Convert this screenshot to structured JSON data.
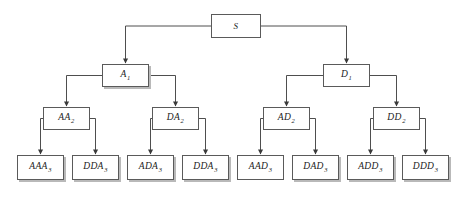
{
  "diagram": {
    "type": "tree",
    "title": "",
    "canvas": {
      "width": 461,
      "height": 197,
      "background": "#ffffff"
    },
    "style": {
      "node_fill": "#ffffff",
      "node_border": "#5a5a5a",
      "edge_color": "#3a3a3a",
      "shadow_color": "#b9b9b9",
      "text_color": "#1a1a1a"
    },
    "levels": [
      {
        "level": 0,
        "name": "root"
      },
      {
        "level": 1,
        "name": "first-expansion"
      },
      {
        "level": 2,
        "name": "second-expansion"
      },
      {
        "level": 3,
        "name": "leaves"
      }
    ],
    "nodes": [
      {
        "id": "S",
        "base": "S",
        "sub": "",
        "level": 0,
        "x": 211,
        "y": 14,
        "w": 50,
        "h": 24,
        "shadow": false
      },
      {
        "id": "A1",
        "base": "A",
        "sub": "1",
        "level": 1,
        "x": 102,
        "y": 64,
        "w": 47,
        "h": 23,
        "shadow": true
      },
      {
        "id": "D1",
        "base": "D",
        "sub": "1",
        "level": 1,
        "x": 323,
        "y": 64,
        "w": 47,
        "h": 23,
        "shadow": false
      },
      {
        "id": "AA2",
        "base": "AA",
        "sub": "2",
        "level": 2,
        "x": 43,
        "y": 107,
        "w": 47,
        "h": 23,
        "shadow": false
      },
      {
        "id": "DA2",
        "base": "DA",
        "sub": "2",
        "level": 2,
        "x": 152,
        "y": 107,
        "w": 47,
        "h": 23,
        "shadow": false
      },
      {
        "id": "AD2",
        "base": "AD",
        "sub": "2",
        "level": 2,
        "x": 263,
        "y": 107,
        "w": 47,
        "h": 23,
        "shadow": false
      },
      {
        "id": "DD2",
        "base": "DD",
        "sub": "2",
        "level": 2,
        "x": 373,
        "y": 107,
        "w": 47,
        "h": 23,
        "shadow": false
      },
      {
        "id": "AAA3",
        "base": "AAA",
        "sub": "3",
        "level": 3,
        "x": 17,
        "y": 155,
        "w": 47,
        "h": 25,
        "shadow": true
      },
      {
        "id": "DDA3",
        "base": "DDA",
        "sub": "3",
        "level": 3,
        "x": 72,
        "y": 155,
        "w": 47,
        "h": 25,
        "shadow": true
      },
      {
        "id": "ADA3",
        "base": "ADA",
        "sub": "3",
        "level": 3,
        "x": 127,
        "y": 155,
        "w": 47,
        "h": 25,
        "shadow": true
      },
      {
        "id": "DDA3b",
        "base": "DDA",
        "sub": "3",
        "level": 3,
        "x": 182,
        "y": 155,
        "w": 47,
        "h": 25,
        "shadow": true
      },
      {
        "id": "AAD3",
        "base": "AAD",
        "sub": "3",
        "level": 3,
        "x": 237,
        "y": 155,
        "w": 47,
        "h": 25,
        "shadow": false
      },
      {
        "id": "DAD3",
        "base": "DAD",
        "sub": "3",
        "level": 3,
        "x": 292,
        "y": 155,
        "w": 47,
        "h": 25,
        "shadow": true
      },
      {
        "id": "ADD3",
        "base": "ADD",
        "sub": "3",
        "level": 3,
        "x": 347,
        "y": 155,
        "w": 47,
        "h": 25,
        "shadow": true
      },
      {
        "id": "DDD3",
        "base": "DDD",
        "sub": "3",
        "level": 3,
        "x": 402,
        "y": 155,
        "w": 47,
        "h": 25,
        "shadow": true
      }
    ],
    "edges": [
      {
        "id": "edge-S-A1",
        "from": "S",
        "to": "A1",
        "side": "left"
      },
      {
        "id": "edge-S-D1",
        "from": "S",
        "to": "D1",
        "side": "right"
      },
      {
        "id": "edge-A1-AA2",
        "from": "A1",
        "to": "AA2",
        "side": "left"
      },
      {
        "id": "edge-A1-DA2",
        "from": "A1",
        "to": "DA2",
        "side": "right"
      },
      {
        "id": "edge-D1-AD2",
        "from": "D1",
        "to": "AD2",
        "side": "left"
      },
      {
        "id": "edge-D1-DD2",
        "from": "D1",
        "to": "DD2",
        "side": "right"
      },
      {
        "id": "edge-AA2-AAA3",
        "from": "AA2",
        "to": "AAA3",
        "side": "left"
      },
      {
        "id": "edge-AA2-DDA3",
        "from": "AA2",
        "to": "DDA3",
        "side": "right"
      },
      {
        "id": "edge-DA2-ADA3",
        "from": "DA2",
        "to": "ADA3",
        "side": "left"
      },
      {
        "id": "edge-DA2-DDA3b",
        "from": "DA2",
        "to": "DDA3b",
        "side": "right"
      },
      {
        "id": "edge-AD2-AAD3",
        "from": "AD2",
        "to": "AAD3",
        "side": "left"
      },
      {
        "id": "edge-AD2-DAD3",
        "from": "AD2",
        "to": "DAD3",
        "side": "right"
      },
      {
        "id": "edge-DD2-ADD3",
        "from": "DD2",
        "to": "ADD3",
        "side": "left"
      },
      {
        "id": "edge-DD2-DDD3",
        "from": "DD2",
        "to": "DDD3",
        "side": "right"
      }
    ]
  }
}
